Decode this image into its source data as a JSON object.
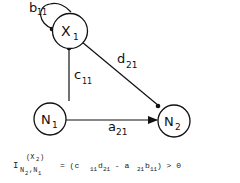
{
  "nodes": {
    "x1": {
      "main": "X",
      "sub": "1"
    },
    "n1": {
      "main": "N",
      "sub": "1"
    },
    "n2": {
      "main": "N",
      "sub": "2"
    }
  },
  "edges": {
    "b11": {
      "main": "b",
      "sub": "11"
    },
    "c11": {
      "main": "c",
      "sub": "11"
    },
    "d21": {
      "main": "d",
      "sub": "21"
    },
    "a21": {
      "main": "a",
      "sub": "21"
    }
  },
  "formula": {
    "I": "I",
    "sup": "(X",
    "sup_sub": "2",
    "sup_close": ")",
    "sub_n2": "N",
    "sub_n2_idx": "2",
    "sub_comma": ",N",
    "sub_n1_idx": "1",
    "eq": "= (c",
    "t1_sub": "11",
    "t1b": "d",
    "t1b_sub": "21",
    "minus": " - a",
    "t2_sub": "21",
    "t2b": "b",
    "t2b_sub": "11",
    "tail": ") > 0"
  }
}
